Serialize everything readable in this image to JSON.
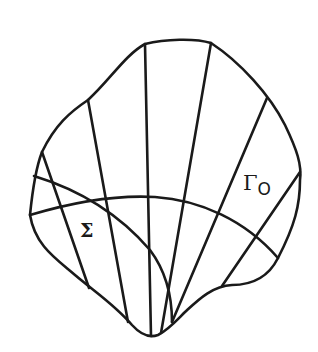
{
  "figure": {
    "labels": {
      "sigma": "Σ",
      "gamma_main": "Γ",
      "gamma_sub": "O"
    },
    "colors": {
      "stroke": "#1a1a1a",
      "background": "#ffffff"
    }
  }
}
